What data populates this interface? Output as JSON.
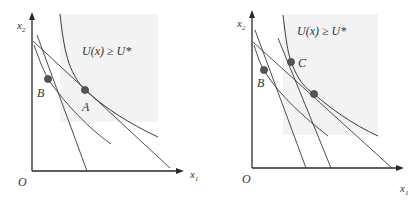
{
  "colors": {
    "axis": "#2a2a2a",
    "line": "#3a3a3a",
    "shade": "#f3f3f3",
    "point": "#555555",
    "point_stroke": "#333333"
  },
  "left_panel": {
    "y_axis_label": "x",
    "y_axis_sub": "2",
    "x_axis_label": "x",
    "x_axis_sub": "1",
    "origin_label": "O",
    "region_label": "U(x) ≥ U*",
    "points": [
      {
        "label": "A"
      },
      {
        "label": "B"
      }
    ]
  },
  "right_panel": {
    "y_axis_label": "x",
    "y_axis_sub": "2",
    "x_axis_label": "x",
    "x_axis_sub": "1",
    "origin_label": "O",
    "region_label": "U(x) ≥ U*",
    "points": [
      {
        "label": "C"
      },
      {
        "label": "B"
      },
      {
        "label": ""
      }
    ]
  }
}
